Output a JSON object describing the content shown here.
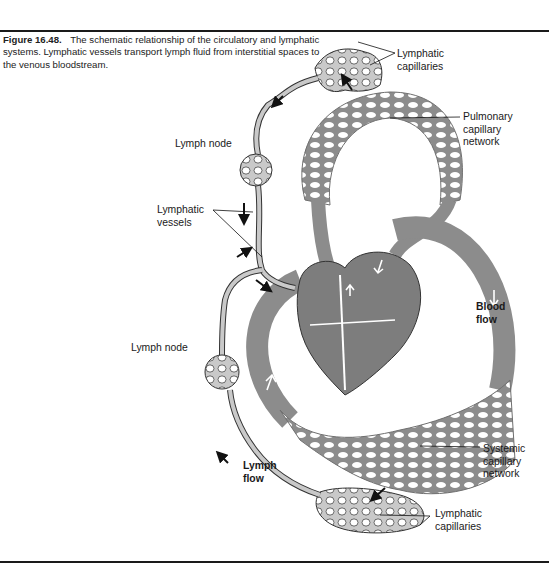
{
  "caption": {
    "figure_number": "Figure 16.48.",
    "text": "The schematic relationship of the circulatory and lymphatic systems. Lymphatic vessels transport lymph fluid from interstitial spaces to the venous bloodstream."
  },
  "labels": {
    "lymphatic_capillaries_top": [
      "Lymphatic",
      "capillaries"
    ],
    "pulmonary_capillary_network": [
      "Pulmonary",
      "capillary",
      "network"
    ],
    "lymph_node_top": "Lymph node",
    "lymphatic_vessels": [
      "Lymphatic",
      "vessels"
    ],
    "blood_flow": [
      "Blood",
      "flow"
    ],
    "lymph_node_bottom": "Lymph node",
    "lymph_flow": [
      "Lymph",
      "flow"
    ],
    "systemic_capillary_network": [
      "Systemic",
      "capillary",
      "network"
    ],
    "lymphatic_capillaries_bottom": [
      "Lymphatic",
      "capillaries"
    ]
  },
  "colors": {
    "blood_vessel": "#8c8c8c",
    "heart": "#7d7d7d",
    "lymphatic": "#c9c9c9",
    "outline": "#333333",
    "rule": "#1a1a1a"
  }
}
